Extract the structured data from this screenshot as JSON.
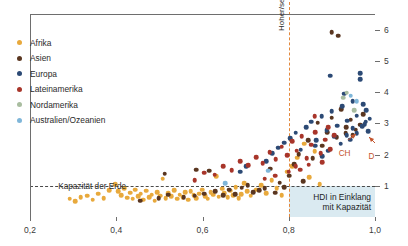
{
  "chart_data": {
    "type": "scatter",
    "title": "",
    "xlabel": "",
    "ylabel": "",
    "xlim": [
      0.2,
      1.0
    ],
    "ylim": [
      0,
      6.5
    ],
    "grid": false,
    "legend_position": "top-left",
    "xticks": [
      "0,2",
      "0,4",
      "0,6",
      "0,8",
      "1,0"
    ],
    "xtick_values": [
      0.2,
      0.4,
      0.6,
      0.8,
      1.0
    ],
    "yticks": [
      "1",
      "2",
      "3",
      "4",
      "5",
      "6"
    ],
    "ytick_values": [
      1,
      2,
      3,
      4,
      5,
      6
    ],
    "reference_lines": [
      {
        "name": "Kapazität der Erde",
        "orientation": "horizontal",
        "value": 1,
        "color": "#4a4a4a",
        "style": "dashed"
      },
      {
        "name": "Hoher/sehr hoher HDI",
        "orientation": "vertical",
        "value": 0.8,
        "color": "#e2883c",
        "style": "dashed"
      }
    ],
    "shaded_region": {
      "label": "HDI in Einklang mit Kapazität",
      "x_range": [
        0.8,
        1.0
      ],
      "y_range": [
        0,
        1
      ],
      "color": "#d3e6ee"
    },
    "annotations": [
      {
        "name": "capacity-line-label",
        "text": "Kapazität der Erde"
      },
      {
        "name": "hdi-threshold-label",
        "text": "Hoher/sehr hoher HDI"
      },
      {
        "name": "balance-box-label",
        "line1": "HDI in Einklang",
        "line2": "mit Kapazität"
      },
      {
        "name": "country-ch",
        "text": "CH",
        "x": 0.955,
        "y": 2.73,
        "color": "#c4552e"
      },
      {
        "name": "country-d",
        "text": "D",
        "x": 0.985,
        "y": 2.62,
        "color": "#c4552e"
      }
    ],
    "series": [
      {
        "name": "Afrika",
        "color": "#e8a93c",
        "points": [
          [
            0.397,
            1.05
          ],
          [
            0.404,
            0.82
          ],
          [
            0.412,
            0.7
          ],
          [
            0.419,
            0.93
          ],
          [
            0.425,
            0.62
          ],
          [
            0.432,
            0.78
          ],
          [
            0.438,
            0.58
          ],
          [
            0.444,
            0.88
          ],
          [
            0.451,
            0.66
          ],
          [
            0.457,
            0.74
          ],
          [
            0.463,
            0.55
          ],
          [
            0.47,
            0.84
          ],
          [
            0.476,
            0.63
          ],
          [
            0.482,
            0.72
          ],
          [
            0.489,
            0.52
          ],
          [
            0.495,
            0.8
          ],
          [
            0.502,
            0.68
          ],
          [
            0.508,
            1.22
          ],
          [
            0.515,
            0.6
          ],
          [
            0.521,
            0.76
          ],
          [
            0.528,
            0.66
          ],
          [
            0.534,
            0.86
          ],
          [
            0.541,
            0.58
          ],
          [
            0.547,
            0.71
          ],
          [
            0.554,
            0.64
          ],
          [
            0.56,
            0.79
          ],
          [
            0.567,
            0.56
          ],
          [
            0.573,
            0.83
          ],
          [
            0.58,
            0.69
          ],
          [
            0.586,
            0.61
          ],
          [
            0.593,
            0.75
          ],
          [
            0.599,
            0.87
          ],
          [
            0.606,
            0.66
          ],
          [
            0.612,
            0.59
          ],
          [
            0.619,
            0.8
          ],
          [
            0.625,
            0.72
          ],
          [
            0.632,
            1.31
          ],
          [
            0.638,
            0.65
          ],
          [
            0.645,
            0.9
          ],
          [
            0.651,
            0.77
          ],
          [
            0.658,
            0.63
          ],
          [
            0.664,
            0.84
          ],
          [
            0.671,
            0.7
          ],
          [
            0.677,
            0.95
          ],
          [
            0.684,
            0.6
          ],
          [
            0.69,
            0.73
          ],
          [
            0.697,
            1.08
          ],
          [
            0.703,
            0.82
          ],
          [
            0.712,
            0.68
          ],
          [
            0.724,
            0.88
          ],
          [
            0.736,
            1.02
          ],
          [
            0.748,
            0.76
          ],
          [
            0.76,
            1.18
          ],
          [
            0.772,
            0.93
          ],
          [
            0.784,
            0.7
          ],
          [
            0.796,
            1.45
          ],
          [
            0.808,
            1.62
          ],
          [
            0.82,
            1.9
          ],
          [
            0.836,
            2.35
          ],
          [
            0.848,
            1.27
          ],
          [
            0.86,
            2.1
          ],
          [
            0.872,
            1.05
          ],
          [
            0.332,
            0.68
          ],
          [
            0.345,
            0.56
          ],
          [
            0.358,
            0.74
          ],
          [
            0.371,
            0.61
          ],
          [
            0.384,
            0.86
          ],
          [
            0.305,
            0.51
          ],
          [
            0.318,
            0.64
          ],
          [
            0.292,
            0.58
          ]
        ]
      },
      {
        "name": "Asien",
        "color": "#5a3620",
        "points": [
          [
            0.455,
            0.52
          ],
          [
            0.498,
            0.6
          ],
          [
            0.521,
            0.71
          ],
          [
            0.556,
            0.63
          ],
          [
            0.582,
            0.68
          ],
          [
            0.604,
            0.75
          ],
          [
            0.616,
            1.48
          ],
          [
            0.629,
            0.82
          ],
          [
            0.648,
            0.7
          ],
          [
            0.662,
            0.88
          ],
          [
            0.676,
            0.73
          ],
          [
            0.691,
            0.94
          ],
          [
            0.705,
            1.02
          ],
          [
            0.718,
            0.8
          ],
          [
            0.731,
            0.86
          ],
          [
            0.744,
            0.92
          ],
          [
            0.757,
            1.55
          ],
          [
            0.768,
            0.78
          ],
          [
            0.779,
            1.1
          ],
          [
            0.79,
            0.95
          ],
          [
            0.801,
            1.32
          ],
          [
            0.812,
            1.7
          ],
          [
            0.823,
            2.02
          ],
          [
            0.834,
            1.15
          ],
          [
            0.845,
            2.46
          ],
          [
            0.856,
            1.88
          ],
          [
            0.867,
            3.02
          ],
          [
            0.878,
            2.28
          ],
          [
            0.889,
            2.72
          ],
          [
            0.9,
            3.18
          ],
          [
            0.911,
            2.55
          ],
          [
            0.922,
            3.45
          ],
          [
            0.933,
            2.88
          ],
          [
            0.944,
            3.12
          ],
          [
            0.955,
            2.8
          ],
          [
            0.966,
            2.95
          ],
          [
            0.9,
            5.92
          ],
          [
            0.915,
            5.8
          ],
          [
            0.972,
            3.3
          ],
          [
            0.932,
            2.68
          ],
          [
            0.512,
            1.38
          ],
          [
            0.586,
            1.52
          ],
          [
            0.948,
            2.62
          ]
        ]
      },
      {
        "name": "Europa",
        "color": "#2c4a75",
        "points": [
          [
            0.748,
            1.78
          ],
          [
            0.762,
            2.05
          ],
          [
            0.776,
            2.22
          ],
          [
            0.79,
            2.38
          ],
          [
            0.804,
            2.52
          ],
          [
            0.816,
            2.7
          ],
          [
            0.828,
            2.15
          ],
          [
            0.84,
            2.88
          ],
          [
            0.852,
            3.05
          ],
          [
            0.864,
            2.45
          ],
          [
            0.876,
            3.22
          ],
          [
            0.888,
            2.78
          ],
          [
            0.9,
            3.38
          ],
          [
            0.912,
            2.92
          ],
          [
            0.924,
            3.55
          ],
          [
            0.936,
            3.08
          ],
          [
            0.948,
            2.85
          ],
          [
            0.958,
            3.25
          ],
          [
            0.966,
            4.6
          ],
          [
            0.966,
            4.42
          ],
          [
            0.972,
            3.62
          ],
          [
            0.976,
            2.98
          ],
          [
            0.98,
            3.42
          ],
          [
            0.984,
            2.75
          ],
          [
            0.988,
            3.15
          ],
          [
            0.948,
            3.7
          ],
          [
            0.934,
            2.62
          ],
          [
            0.92,
            2.35
          ],
          [
            0.906,
            2.58
          ],
          [
            0.892,
            2.12
          ],
          [
            0.878,
            1.95
          ],
          [
            0.862,
            2.28
          ],
          [
            0.896,
            4.52
          ],
          [
            0.958,
            2.68
          ],
          [
            0.97,
            2.9
          ],
          [
            0.702,
            1.62
          ],
          [
            0.688,
            1.45
          ],
          [
            0.978,
            3.05
          ],
          [
            0.942,
            2.48
          ],
          [
            0.928,
            3.95
          ]
        ]
      },
      {
        "name": "Lateinamerika",
        "color": "#a8352a",
        "points": [
          [
            0.582,
            1.18
          ],
          [
            0.604,
            1.42
          ],
          [
            0.628,
            1.35
          ],
          [
            0.648,
            1.62
          ],
          [
            0.668,
            1.5
          ],
          [
            0.688,
            1.78
          ],
          [
            0.706,
            1.65
          ],
          [
            0.724,
            1.92
          ],
          [
            0.74,
            1.72
          ],
          [
            0.756,
            2.08
          ],
          [
            0.77,
            1.85
          ],
          [
            0.784,
            2.25
          ],
          [
            0.796,
            1.98
          ],
          [
            0.808,
            2.42
          ],
          [
            0.818,
            2.12
          ],
          [
            0.83,
            2.58
          ],
          [
            0.842,
            1.88
          ],
          [
            0.852,
            2.32
          ],
          [
            0.862,
            2.72
          ],
          [
            0.874,
            2.05
          ],
          [
            0.884,
            2.48
          ],
          [
            0.896,
            2.18
          ],
          [
            0.906,
            2.62
          ],
          [
            0.826,
            1.52
          ],
          [
            0.846,
            1.68
          ],
          [
            0.768,
            1.32
          ],
          [
            0.744,
            1.22
          ],
          [
            0.8,
            1.45
          ],
          [
            0.816,
            1.62
          ],
          [
            0.86,
            3.22
          ],
          [
            0.878,
            1.75
          ],
          [
            0.892,
            2.88
          ]
        ]
      },
      {
        "name": "Nordamerika",
        "color": "#a9bda0",
        "points": [
          [
            0.934,
            3.98
          ],
          [
            0.926,
            3.82
          ],
          [
            0.952,
            3.42
          ]
        ]
      },
      {
        "name": "Australien/Ozeanien",
        "color": "#7fb6d9",
        "points": [
          [
            0.652,
            1.08
          ],
          [
            0.944,
            3.88
          ],
          [
            0.958,
            3.7
          ],
          [
            0.752,
            1.48
          ]
        ]
      }
    ]
  },
  "legend": {
    "items": [
      {
        "label": "Afrika",
        "color": "#e8a93c"
      },
      {
        "label": "Asien",
        "color": "#5a3620"
      },
      {
        "label": "Europa",
        "color": "#2c4a75"
      },
      {
        "label": "Lateinamerika",
        "color": "#a8352a"
      },
      {
        "label": "Nordamerika",
        "color": "#a9bda0"
      },
      {
        "label": "Australien/Ozeanien",
        "color": "#7fb6d9"
      }
    ]
  }
}
